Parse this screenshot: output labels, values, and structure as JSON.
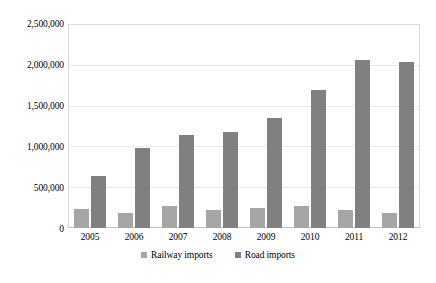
{
  "chart_data": {
    "type": "bar",
    "title": "",
    "xlabel": "",
    "ylabel": "",
    "ylim": [
      0,
      2500000
    ],
    "ytick_labels": [
      "2,500,000",
      "2,000,000",
      "1,500,000",
      "1,000,000",
      "500,000",
      "0"
    ],
    "ytick_values": [
      2500000,
      2000000,
      1500000,
      1000000,
      500000,
      0
    ],
    "grid": true,
    "legend_position": "bottom",
    "categories": [
      "2005",
      "2006",
      "2007",
      "2008",
      "2009",
      "2010",
      "2011",
      "2012"
    ],
    "series": [
      {
        "name": "Railway imports",
        "color": "#a6a6a6",
        "values": [
          235000,
          180000,
          265000,
          220000,
          240000,
          265000,
          220000,
          190000
        ]
      },
      {
        "name": "Road imports",
        "color": "#808080",
        "values": [
          640000,
          980000,
          1140000,
          1175000,
          1345000,
          1690000,
          2060000,
          2030000
        ]
      }
    ]
  },
  "legend": {
    "items": [
      {
        "label": "Railway imports",
        "marker": "square-swatch-light"
      },
      {
        "label": "Road imports",
        "marker": "square-swatch-dark"
      }
    ]
  }
}
